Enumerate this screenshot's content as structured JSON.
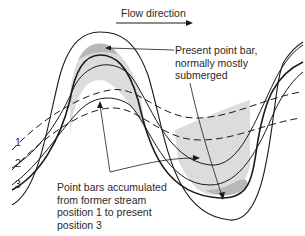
{
  "diagram": {
    "flow_label": "Flow direction",
    "present_bar_label": [
      "Present point bar,",
      "normally mostly",
      "submerged"
    ],
    "accumulated_label": [
      "Point bars accumulated",
      "from former stream",
      "position 1 to present",
      "position 3"
    ],
    "positions": [
      "1",
      "2",
      "3"
    ],
    "colors": {
      "line": "#1a1a1a",
      "point_bar_fill": "#dcdcdc",
      "present_bar_fill": "#b8b8b8"
    }
  }
}
